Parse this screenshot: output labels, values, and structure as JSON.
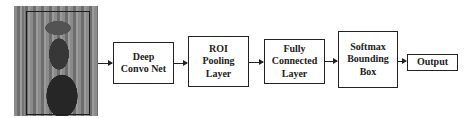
{
  "diagram": {
    "type": "pipeline-flowchart",
    "input_image": {
      "description": "photo of a cowboy on horseback with a bounding box"
    },
    "stages": [
      {
        "id": "deep-convo-net",
        "lines": [
          "Deep",
          "Convo Net"
        ]
      },
      {
        "id": "roi-pooling-layer",
        "lines": [
          "ROI",
          "Pooling",
          "Layer"
        ]
      },
      {
        "id": "fully-connected-layer",
        "lines": [
          "Fully",
          "Connected",
          "Layer"
        ]
      },
      {
        "id": "softmax-bounding-box",
        "lines": [
          "Softmax",
          "Bounding",
          "Box"
        ]
      },
      {
        "id": "output",
        "lines": [
          "Output"
        ]
      }
    ],
    "edges": [
      [
        "input_image",
        "deep-convo-net"
      ],
      [
        "deep-convo-net",
        "roi-pooling-layer"
      ],
      [
        "roi-pooling-layer",
        "fully-connected-layer"
      ],
      [
        "fully-connected-layer",
        "softmax-bounding-box"
      ],
      [
        "softmax-bounding-box",
        "output"
      ]
    ],
    "colors": {
      "stroke": "#222222",
      "fill": "#ffffff",
      "text": "#222222"
    }
  }
}
